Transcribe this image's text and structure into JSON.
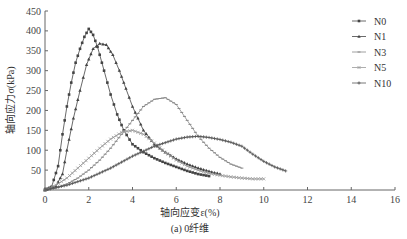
{
  "chart_data": {
    "type": "line",
    "title": "",
    "caption": "(a) 0纤维",
    "xlabel": "轴向应变ε(%)",
    "ylabel": "轴向应力σ(kPa)",
    "xlim": [
      0,
      16
    ],
    "ylim": [
      0,
      450
    ],
    "xticks": [
      0,
      2,
      4,
      6,
      8,
      10,
      12,
      14,
      16
    ],
    "yticks": [
      0,
      50,
      100,
      150,
      200,
      250,
      300,
      350,
      400,
      450
    ],
    "grid": false,
    "legend_position": "upper right",
    "series": [
      {
        "name": "N0",
        "marker": "square",
        "color": "#444444",
        "x": [
          0,
          0.3,
          0.6,
          0.8,
          1.0,
          1.2,
          1.4,
          1.6,
          1.8,
          2.0,
          2.2,
          2.4,
          2.7,
          3.0,
          3.3,
          3.6,
          4.0,
          4.5,
          5.0,
          5.5,
          6.0,
          6.5,
          7.0,
          7.5
        ],
        "y": [
          0,
          8,
          60,
          140,
          210,
          270,
          320,
          355,
          385,
          405,
          390,
          360,
          300,
          240,
          190,
          150,
          115,
          95,
          80,
          68,
          58,
          48,
          40,
          35
        ]
      },
      {
        "name": "N1",
        "marker": "triangle",
        "color": "#444444",
        "x": [
          0,
          0.5,
          0.8,
          1.0,
          1.3,
          1.6,
          1.9,
          2.2,
          2.5,
          2.8,
          3.1,
          3.4,
          3.7,
          4.0,
          4.5,
          5.0,
          5.5,
          6.0,
          6.5,
          7.0,
          7.5,
          8.0
        ],
        "y": [
          0,
          10,
          40,
          100,
          180,
          250,
          315,
          355,
          368,
          365,
          340,
          300,
          255,
          210,
          150,
          115,
          95,
          78,
          65,
          55,
          47,
          40
        ]
      },
      {
        "name": "N3",
        "marker": "dash",
        "color": "#888888",
        "x": [
          0,
          0.5,
          1.0,
          1.5,
          2.0,
          2.5,
          3.0,
          3.5,
          4.0,
          4.5,
          5.0,
          5.5,
          6.0,
          6.5,
          7.0,
          7.5,
          8.0,
          8.5,
          9.0
        ],
        "y": [
          0,
          5,
          15,
          30,
          50,
          75,
          105,
          140,
          175,
          210,
          228,
          232,
          215,
          175,
          135,
          105,
          82,
          65,
          55
        ]
      },
      {
        "name": "N5",
        "marker": "x",
        "color": "#999999",
        "x": [
          0,
          0.5,
          1.0,
          1.5,
          2.0,
          2.5,
          3.0,
          3.5,
          4.0,
          4.5,
          5.0,
          5.5,
          6.0,
          6.5,
          7.0,
          7.5,
          8.0,
          8.5,
          9.0,
          9.5,
          10.0
        ],
        "y": [
          0,
          12,
          30,
          55,
          80,
          105,
          128,
          145,
          150,
          140,
          118,
          95,
          75,
          60,
          50,
          42,
          37,
          33,
          30,
          28,
          28
        ]
      },
      {
        "name": "N10",
        "marker": "plus",
        "color": "#555555",
        "x": [
          0,
          1.0,
          2.0,
          3.0,
          4.0,
          5.0,
          6.0,
          6.5,
          7.0,
          7.5,
          8.0,
          8.5,
          9.0,
          9.5,
          10.0,
          10.5,
          11.0
        ],
        "y": [
          0,
          12,
          30,
          55,
          85,
          110,
          128,
          133,
          135,
          132,
          127,
          120,
          110,
          90,
          72,
          58,
          48
        ]
      }
    ]
  },
  "legend": {
    "items": [
      "N0",
      "N1",
      "N3",
      "N5",
      "N10"
    ]
  }
}
